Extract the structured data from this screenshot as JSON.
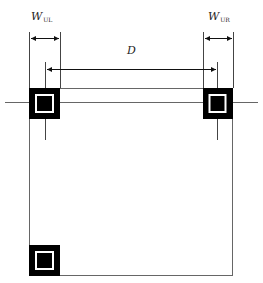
{
  "diagram": {
    "type": "QR code finder pattern layout dimensions",
    "labels": {
      "w_ul_main": "W",
      "w_ul_sub": "UL",
      "w_ur_main": "W",
      "w_ur_sub": "UR",
      "distance": "D"
    },
    "markers": [
      {
        "name": "upper-left",
        "x": 29,
        "y": 88,
        "size": 31
      },
      {
        "name": "upper-right",
        "x": 203,
        "y": 88,
        "size": 30
      },
      {
        "name": "lower-left",
        "x": 29,
        "y": 245,
        "size": 31
      }
    ],
    "frame": {
      "left": 29,
      "top": 88,
      "right": 232,
      "bottom": 275
    },
    "colors": {
      "line": "#555555",
      "marker": "#000000",
      "background": "#ffffff"
    }
  }
}
